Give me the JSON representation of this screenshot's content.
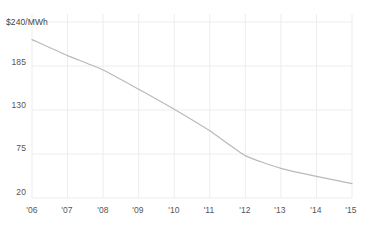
{
  "chart_data": {
    "type": "line",
    "title": "",
    "xlabel": "",
    "ylabel": "$240/MWh",
    "units_label": "$240/MWh",
    "categories": [
      "'06",
      "'07",
      "'08",
      "'09",
      "'10",
      "'11",
      "'12",
      "'13",
      "'14",
      "'15"
    ],
    "x": [
      2006,
      2007,
      2008,
      2009,
      2010,
      2011,
      2012,
      2013,
      2014,
      2015
    ],
    "values": [
      218,
      198,
      180,
      156,
      131,
      104,
      73,
      57,
      47,
      38
    ],
    "series": [
      {
        "name": "Price",
        "values": [
          218,
          198,
          180,
          156,
          131,
          104,
          73,
          57,
          47,
          38
        ]
      }
    ],
    "ylim": [
      20,
      240
    ],
    "xlim": [
      2006,
      2015
    ],
    "ytick_values": [
      240,
      185,
      130,
      75,
      20
    ],
    "ytick_labels": [
      "$240/MWh",
      "185",
      "130",
      "75",
      "20"
    ],
    "xtick_labels": [
      "'06",
      "'07",
      "'08",
      "'09",
      "'10",
      "'11",
      "'12",
      "'13",
      "'14",
      "'15"
    ],
    "grid": true,
    "grid_color": "#ededed",
    "line_color": "#b9b9b9",
    "line_width": 1.2,
    "legend": "none",
    "legend_position": "none",
    "annotations": []
  },
  "axis": {
    "y_ticks": [
      {
        "label": "$240/MWh",
        "value": 240
      },
      {
        "label": "185",
        "value": 185
      },
      {
        "label": "130",
        "value": 130
      },
      {
        "label": "75",
        "value": 75
      },
      {
        "label": "20",
        "value": 20
      }
    ],
    "x_ticks": [
      {
        "label": "'06",
        "value": 2006
      },
      {
        "label": "'07",
        "value": 2007
      },
      {
        "label": "'08",
        "value": 2008
      },
      {
        "label": "'09",
        "value": 2009
      },
      {
        "label": "'10",
        "value": 2010
      },
      {
        "label": "'11",
        "value": 2011
      },
      {
        "label": "'12",
        "value": 2012
      },
      {
        "label": "'13",
        "value": 2013
      },
      {
        "label": "'14",
        "value": 2014
      },
      {
        "label": "'15",
        "value": 2015
      }
    ]
  }
}
